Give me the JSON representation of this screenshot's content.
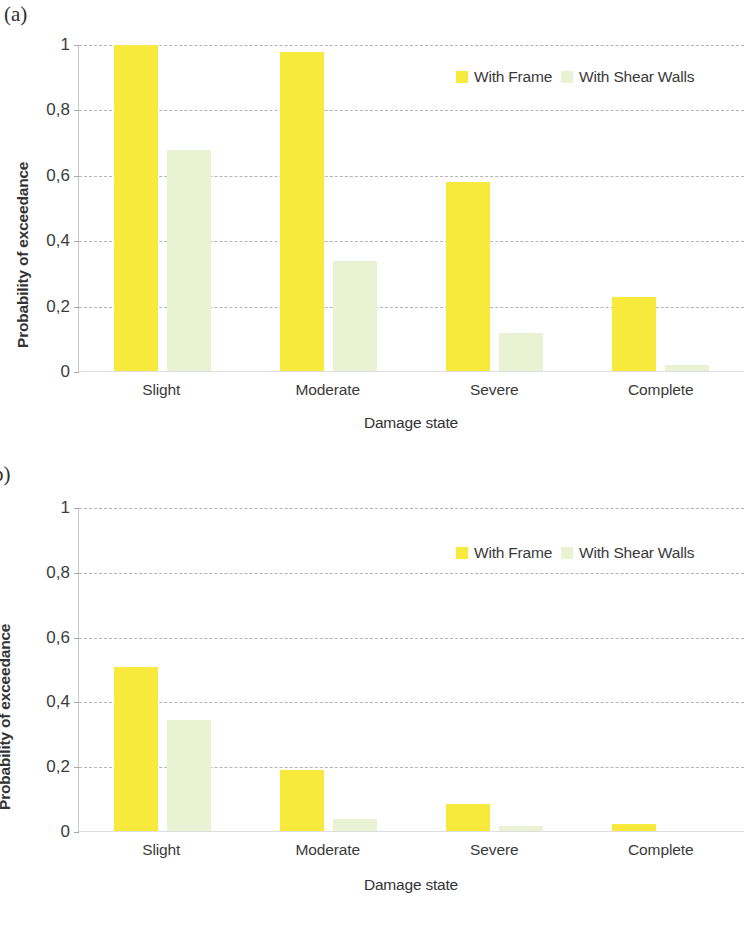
{
  "figure": {
    "panels": [
      {
        "letter": "(a)",
        "xtitle": "Damage state",
        "ytitle": "Probability of exceedance",
        "ytick_labels": [
          "1",
          "0,8",
          "0,6",
          "0,4",
          "0,2",
          "0"
        ],
        "legend": [
          {
            "label": "With Frame",
            "color": "#f7ea3d"
          },
          {
            "label": "With Shear Walls",
            "color": "#e9f3d4"
          }
        ],
        "chart_data": {
          "type": "bar",
          "title": "(a)",
          "xlabel": "Damage state",
          "ylabel": "Probability of exceedance",
          "ylim": [
            0,
            1
          ],
          "yticks": [
            0,
            0.2,
            0.4,
            0.6,
            0.8,
            1
          ],
          "ytick_labels": [
            "0",
            "0,2",
            "0,4",
            "0,6",
            "0,8",
            "1"
          ],
          "grid": "horizontal-dashed",
          "legend_position": "top-right-inside",
          "categories": [
            "Slight",
            "Moderate",
            "Severe",
            "Complete"
          ],
          "series": [
            {
              "name": "With Frame",
              "color": "#f7ea3d",
              "values": [
                1.0,
                0.98,
                0.58,
                0.23
              ]
            },
            {
              "name": "With Shear Walls",
              "color": "#e9f3d4",
              "values": [
                0.68,
                0.34,
                0.12,
                0.02
              ]
            }
          ]
        }
      },
      {
        "letter": "b)",
        "xtitle": "Damage state",
        "ytitle": "Probability of exceedance",
        "ytick_labels": [
          "1",
          "0,8",
          "0,6",
          "0,4",
          "0,2",
          "0"
        ],
        "legend": [
          {
            "label": "With Frame",
            "color": "#f7ea3d"
          },
          {
            "label": "With Shear Walls",
            "color": "#e9f3d4"
          }
        ],
        "chart_data": {
          "type": "bar",
          "title": "b)",
          "xlabel": "Damage state",
          "ylabel": "Probability of exceedance",
          "ylim": [
            0,
            1
          ],
          "yticks": [
            0,
            0.2,
            0.4,
            0.6,
            0.8,
            1
          ],
          "ytick_labels": [
            "0",
            "0,2",
            "0,4",
            "0,6",
            "0,8",
            "1"
          ],
          "grid": "horizontal-dashed",
          "legend_position": "top-right-inside",
          "categories": [
            "Slight",
            "Moderate",
            "Severe",
            "Complete"
          ],
          "series": [
            {
              "name": "With Frame",
              "color": "#f7ea3d",
              "values": [
                0.51,
                0.19,
                0.085,
                0.025
              ]
            },
            {
              "name": "With Shear Walls",
              "color": "#e9f3d4",
              "values": [
                0.345,
                0.04,
                0.02,
                0.0
              ]
            }
          ]
        }
      }
    ]
  }
}
